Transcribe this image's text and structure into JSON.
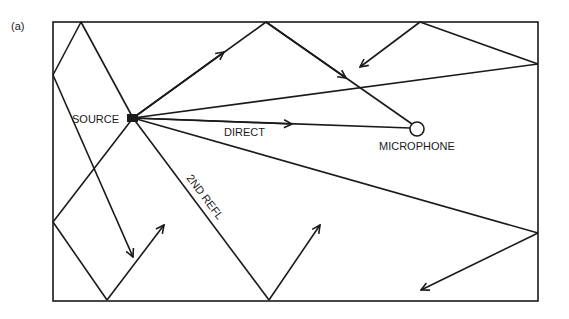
{
  "figure": {
    "panel_label": "(a)",
    "labels": {
      "source": "SOURCE",
      "direct": "DIRECT",
      "microphone": "MICROPHONE",
      "second_reflection": "2ND REFL"
    },
    "room": {
      "x1": 53,
      "y1": 22,
      "x2": 538,
      "y2": 301
    },
    "source_point": [
      133,
      118
    ],
    "microphone_point": [
      417,
      129
    ]
  }
}
